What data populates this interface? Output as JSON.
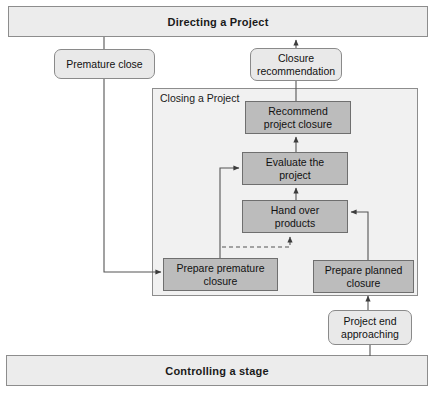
{
  "diagram": {
    "colors": {
      "banner_fill": "#ececec",
      "container_fill": "#f1f1f1",
      "process_fill": "#bcbcbc",
      "rounded_fill": "#e9e9e9",
      "line": "#555555",
      "border": "#8d8d8d"
    }
  },
  "banners": [
    {
      "id": "directing",
      "label": "Directing a Project"
    },
    {
      "id": "controlling",
      "label": "Controlling a stage"
    }
  ],
  "container": {
    "label": "Closing a Project"
  },
  "rounded_nodes": [
    {
      "id": "premature-close",
      "label": "Premature close"
    },
    {
      "id": "closure-recommendation",
      "label": "Closure\nrecommendation",
      "line1": "Closure",
      "line2": "recommendation"
    },
    {
      "id": "project-end-approaching",
      "label": "Project end approaching",
      "line1": "Project end",
      "line2": "approaching"
    }
  ],
  "process_nodes": [
    {
      "id": "recommend-project-closure",
      "line1": "Recommend",
      "line2": "project closure"
    },
    {
      "id": "evaluate-the-project",
      "line1": "Evaluate the",
      "line2": "project"
    },
    {
      "id": "hand-over-products",
      "line1": "Hand over",
      "line2": "products"
    },
    {
      "id": "prepare-premature-closure",
      "line1": "Prepare premature",
      "line2": "closure"
    },
    {
      "id": "prepare-planned-closure",
      "line1": "Prepare planned",
      "line2": "closure"
    }
  ],
  "connectors": [
    {
      "id": "directing-to-premature-close",
      "style": "solid",
      "from": "directing",
      "to": "premature-close"
    },
    {
      "id": "premature-close-to-prepare-premature-closure",
      "style": "solid",
      "from": "premature-close",
      "to": "prepare-premature-closure"
    },
    {
      "id": "closure-recommendation-to-directing",
      "style": "solid",
      "from": "closure-recommendation",
      "to": "directing"
    },
    {
      "id": "recommend-project-closure-to-closure-recommendation",
      "style": "solid",
      "from": "recommend-project-closure",
      "to": "closure-recommendation"
    },
    {
      "id": "evaluate-to-recommend",
      "style": "solid",
      "from": "evaluate-the-project",
      "to": "recommend-project-closure"
    },
    {
      "id": "hand-over-to-evaluate",
      "style": "solid",
      "from": "hand-over-products",
      "to": "evaluate-the-project"
    },
    {
      "id": "prepare-premature-closure-to-evaluate",
      "style": "solid",
      "from": "prepare-premature-closure",
      "to": "evaluate-the-project"
    },
    {
      "id": "prepare-premature-closure-to-hand-over",
      "style": "dashed",
      "from": "prepare-premature-closure",
      "to": "hand-over-products"
    },
    {
      "id": "prepare-planned-closure-to-hand-over",
      "style": "solid",
      "from": "prepare-planned-closure",
      "to": "hand-over-products"
    },
    {
      "id": "project-end-approaching-to-prepare-planned-closure",
      "style": "solid",
      "from": "project-end-approaching",
      "to": "prepare-planned-closure"
    },
    {
      "id": "controlling-to-project-end-approaching",
      "style": "solid",
      "from": "controlling",
      "to": "project-end-approaching"
    }
  ]
}
